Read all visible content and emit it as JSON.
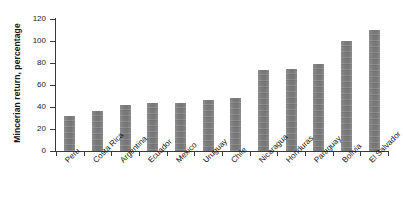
{
  "chart_data": {
    "type": "bar",
    "title": "",
    "subtitle": "",
    "xlabel": "",
    "ylabel": "Mincerian return, percentage",
    "ylim": [
      0,
      120
    ],
    "yticks": [
      0,
      20,
      40,
      60,
      80,
      100,
      120
    ],
    "grid": false,
    "legend": null,
    "orientation": "vertical",
    "bar_color": "#7d7d7d",
    "categories": [
      "Peru",
      "Costa Rica",
      "Argentina",
      "Ecuador",
      "Mexico",
      "Uruguay",
      "Chile",
      "Nicaragua",
      "Honduras",
      "Paraguay",
      "Bolivia",
      "El Salvador"
    ],
    "values": [
      32,
      36,
      42,
      44,
      44,
      46,
      48,
      74,
      75,
      79,
      100,
      110
    ]
  },
  "axis": {
    "y_title": "Mincerian return, percentage",
    "tick_labels": [
      "0",
      "20",
      "40",
      "60",
      "80",
      "100",
      "120"
    ]
  }
}
